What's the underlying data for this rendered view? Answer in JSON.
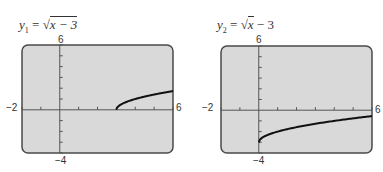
{
  "chart_data": [
    {
      "type": "line",
      "title": "y1 = √(x − 3)",
      "equation": {
        "lhs": "y",
        "sub": "1",
        "rhs_radical": "x − 3",
        "rhs_after": ""
      },
      "xlim": [
        -2,
        6
      ],
      "ylim": [
        -4,
        6
      ],
      "xscale": 1,
      "yscale": 1,
      "grid": false,
      "tick_labels": {
        "xmin": "−2",
        "xmax": "6",
        "ymin": "−4",
        "ymax": "6"
      },
      "x": [
        3,
        3.25,
        3.5,
        4,
        4.5,
        5,
        5.5,
        6
      ],
      "y": [
        0,
        0.5,
        0.71,
        1,
        1.22,
        1.41,
        1.58,
        1.73
      ]
    },
    {
      "type": "line",
      "title": "y2 = √x − 3",
      "equation": {
        "lhs": "y",
        "sub": "2",
        "rhs_radical": "x",
        "rhs_after": " − 3"
      },
      "xlim": [
        -2,
        6
      ],
      "ylim": [
        -4,
        6
      ],
      "xscale": 1,
      "yscale": 1,
      "grid": false,
      "tick_labels": {
        "xmin": "−2",
        "xmax": "6",
        "ymin": "−4",
        "ymax": "6"
      },
      "x": [
        0,
        0.25,
        0.5,
        1,
        2,
        3,
        4,
        5,
        6
      ],
      "y": [
        -3,
        -2.5,
        -2.29,
        -2,
        -1.59,
        -1.27,
        -1,
        -0.76,
        -0.55
      ]
    }
  ],
  "colors": {
    "screen": "#d9d9d9",
    "border": "#4a4a4a",
    "curve": "#111111",
    "axis": "#555555"
  }
}
